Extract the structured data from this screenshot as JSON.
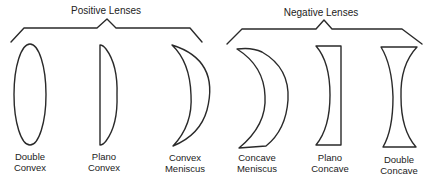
{
  "groups": [
    {
      "title": "Positive Lenses",
      "lenses": [
        {
          "line1": "Double",
          "line2": "Convex",
          "shape": "double-convex"
        },
        {
          "line1": "Plano",
          "line2": "Convex",
          "shape": "plano-convex"
        },
        {
          "line1": "Convex",
          "line2": "Meniscus",
          "shape": "convex-meniscus"
        }
      ]
    },
    {
      "title": "Negative Lenses",
      "lenses": [
        {
          "line1": "Concave",
          "line2": "Meniscus",
          "shape": "concave-meniscus"
        },
        {
          "line1": "Plano",
          "line2": "Concave",
          "shape": "plano-concave"
        },
        {
          "line1": "Double",
          "line2": "Concave",
          "shape": "double-concave"
        }
      ]
    }
  ],
  "colors": {
    "stroke": "#2a2a2a",
    "text": "#222222",
    "background": "#ffffff"
  }
}
